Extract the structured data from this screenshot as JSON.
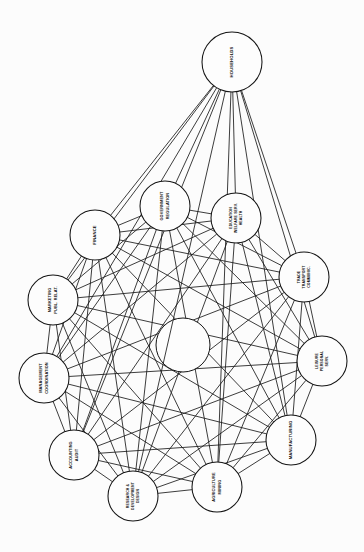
{
  "diagram": {
    "type": "network-graph",
    "title": "",
    "background_color": "#fcfcfc",
    "line_color": "#1a1a1a",
    "node_fill": "#fdfdfd",
    "node_stroke": "#141414",
    "label_color": "#0d0d0d",
    "label_rotation_degrees": -90,
    "center_circle": {
      "label": "",
      "radius": 27,
      "cx": 183,
      "cy": 345
    },
    "hub": {
      "id": "households",
      "label_lines": [
        "HOUSEHOLDS"
      ],
      "cx": 232,
      "cy": 62,
      "r": 30,
      "connects_to_all_ring_nodes": true
    },
    "ring_nodes": [
      {
        "id": "government-regulation",
        "label_lines": [
          "GOVERNMENT",
          "REGULATION"
        ],
        "cx": 165,
        "cy": 206,
        "r": 25
      },
      {
        "id": "education-welfare-health",
        "label_lines": [
          "EDUCATION",
          "WELFARE SERV.",
          "HEALTH"
        ],
        "cx": 236,
        "cy": 218,
        "r": 25
      },
      {
        "id": "trade-transport-communic",
        "label_lines": [
          "TRADE",
          "TRANSPORT",
          "COMMUNIC."
        ],
        "cx": 304,
        "cy": 277,
        "r": 25
      },
      {
        "id": "leisure-personal-serv",
        "label_lines": [
          "LEISURE",
          "PERSONAL",
          "SERV."
        ],
        "cx": 322,
        "cy": 361,
        "r": 25
      },
      {
        "id": "manufacturing",
        "label_lines": [
          "MANUFACTURING"
        ],
        "cx": 291,
        "cy": 440,
        "r": 25
      },
      {
        "id": "agriculture-mining",
        "label_lines": [
          "AGRICULTURE",
          "MINING"
        ],
        "cx": 217,
        "cy": 487,
        "r": 25
      },
      {
        "id": "research-development-design",
        "label_lines": [
          "RESEARCH &",
          "DEVELOPMENT",
          "DESIGN"
        ],
        "cx": 133,
        "cy": 496,
        "r": 25
      },
      {
        "id": "accounting-audit",
        "label_lines": [
          "ACCOUNTING",
          "AUDIT"
        ],
        "cx": 74,
        "cy": 455,
        "r": 25
      },
      {
        "id": "management-coordination",
        "label_lines": [
          "MANAGEMENT",
          "COORDINATION"
        ],
        "cx": 44,
        "cy": 378,
        "r": 25
      },
      {
        "id": "marketing-publ-relat",
        "label_lines": [
          "MARKETING",
          "PUBL. RELAT."
        ],
        "cx": 53,
        "cy": 300,
        "r": 25
      },
      {
        "id": "finance",
        "label_lines": [
          "FINANCE"
        ],
        "cx": 95,
        "cy": 235,
        "r": 25
      }
    ]
  }
}
